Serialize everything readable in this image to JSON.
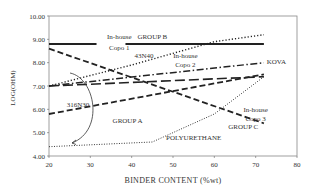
{
  "chart_data": {
    "type": "line",
    "title": "",
    "xlabel": "BINDER CONTENT (%wt)",
    "ylabel": "LOG(OHM)",
    "xlim": [
      20,
      80
    ],
    "ylim": [
      4.0,
      10.0
    ],
    "x_ticks": [
      "20",
      "30",
      "40",
      "50",
      "60",
      "70",
      "80"
    ],
    "y_ticks": [
      "4.00",
      "5.00",
      "6.00",
      "7.00",
      "8.00",
      "9.00",
      "10.00"
    ],
    "grid": false,
    "legend": "inline labels",
    "series": [
      {
        "name": "In-house Copo 1 / GROUP B",
        "style": "solid-thick",
        "x": [
          20,
          72
        ],
        "y": [
          8.8,
          8.8
        ]
      },
      {
        "name": "43N40",
        "style": "dashed",
        "x": [
          20,
          72
        ],
        "y": [
          8.6,
          5.4
        ]
      },
      {
        "name": "In-house Copo 2",
        "style": "dotted",
        "x": [
          20,
          40,
          60,
          72
        ],
        "y": [
          7.0,
          7.9,
          8.9,
          9.2
        ]
      },
      {
        "name": "KOVA",
        "style": "dash-dot",
        "x": [
          20,
          72
        ],
        "y": [
          7.0,
          8.0
        ]
      },
      {
        "name": "In-house Copo 3",
        "style": "long-dash",
        "x": [
          20,
          72
        ],
        "y": [
          7.0,
          7.4
        ]
      },
      {
        "name": "316N30",
        "style": "dashed",
        "x": [
          20,
          72
        ],
        "y": [
          5.8,
          7.5
        ]
      },
      {
        "name": "POLYURETHANE",
        "style": "dotted-fine",
        "x": [
          20,
          45,
          60,
          72
        ],
        "y": [
          4.4,
          4.6,
          5.8,
          7.4
        ]
      }
    ],
    "annotations": [
      {
        "text": "In-house",
        "x": 37,
        "y": 9.0
      },
      {
        "text": "Copo 1",
        "x": 37,
        "y": 8.55
      },
      {
        "text": "GROUP B",
        "x": 45,
        "y": 9.0
      },
      {
        "text": "43N40",
        "x": 43,
        "y": 8.2
      },
      {
        "text": "In-house",
        "x": 53,
        "y": 8.2
      },
      {
        "text": "Copo 2",
        "x": 53,
        "y": 7.8
      },
      {
        "text": "KOVA",
        "x": 75,
        "y": 7.95
      },
      {
        "text": "316N30",
        "x": 27,
        "y": 6.1
      },
      {
        "text": "GROUP A",
        "x": 39,
        "y": 5.4
      },
      {
        "text": "POLYURETHANE",
        "x": 55,
        "y": 4.7
      },
      {
        "text": "In-house",
        "x": 70,
        "y": 5.9
      },
      {
        "text": "Copo 3",
        "x": 70,
        "y": 5.5
      },
      {
        "text": "GROUP C",
        "x": 67,
        "y": 5.15
      }
    ]
  }
}
